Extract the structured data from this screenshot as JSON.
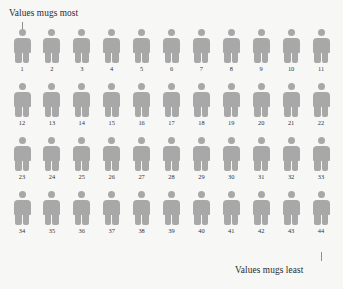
{
  "annotations": {
    "most_label": "Values mugs most",
    "least_label": "Values mugs least"
  },
  "colors": {
    "background": "#f7f7f5",
    "figure": "#a8a8a8",
    "text": "#2b2b2b",
    "tick": "#8f8f8f"
  },
  "chart_data": {
    "type": "pictogram",
    "title": "",
    "xlabel": "",
    "ylabel": "",
    "grid": false,
    "legend_position": "none",
    "rows": 4,
    "columns": 11,
    "total_figures": 44,
    "unit_label": "person",
    "annotations": [
      {
        "text": "Values mugs most",
        "points_to": 1,
        "position": "top-left"
      },
      {
        "text": "Values mugs least",
        "points_to": 44,
        "position": "bottom-right"
      }
    ],
    "categories": [
      "1",
      "2",
      "3",
      "4",
      "5",
      "6",
      "7",
      "8",
      "9",
      "10",
      "11",
      "12",
      "13",
      "14",
      "15",
      "16",
      "17",
      "18",
      "19",
      "20",
      "21",
      "22",
      "23",
      "24",
      "25",
      "26",
      "27",
      "28",
      "29",
      "30",
      "31",
      "32",
      "33",
      "34",
      "35",
      "36",
      "37",
      "38",
      "39",
      "40",
      "41",
      "42",
      "43",
      "44"
    ],
    "values": [
      1,
      1,
      1,
      1,
      1,
      1,
      1,
      1,
      1,
      1,
      1,
      1,
      1,
      1,
      1,
      1,
      1,
      1,
      1,
      1,
      1,
      1,
      1,
      1,
      1,
      1,
      1,
      1,
      1,
      1,
      1,
      1,
      1,
      1,
      1,
      1,
      1,
      1,
      1,
      1,
      1,
      1,
      1,
      1
    ],
    "rows_data": [
      {
        "labels": [
          "1",
          "2",
          "3",
          "4",
          "5",
          "6",
          "7",
          "8",
          "9",
          "10",
          "11"
        ]
      },
      {
        "labels": [
          "12",
          "13",
          "14",
          "15",
          "16",
          "17",
          "18",
          "19",
          "20",
          "21",
          "22"
        ]
      },
      {
        "labels": [
          "23",
          "24",
          "25",
          "26",
          "27",
          "28",
          "29",
          "30",
          "31",
          "32",
          "33"
        ]
      },
      {
        "labels": [
          "34",
          "35",
          "36",
          "37",
          "38",
          "39",
          "40",
          "41",
          "42",
          "43",
          "44"
        ]
      }
    ]
  }
}
